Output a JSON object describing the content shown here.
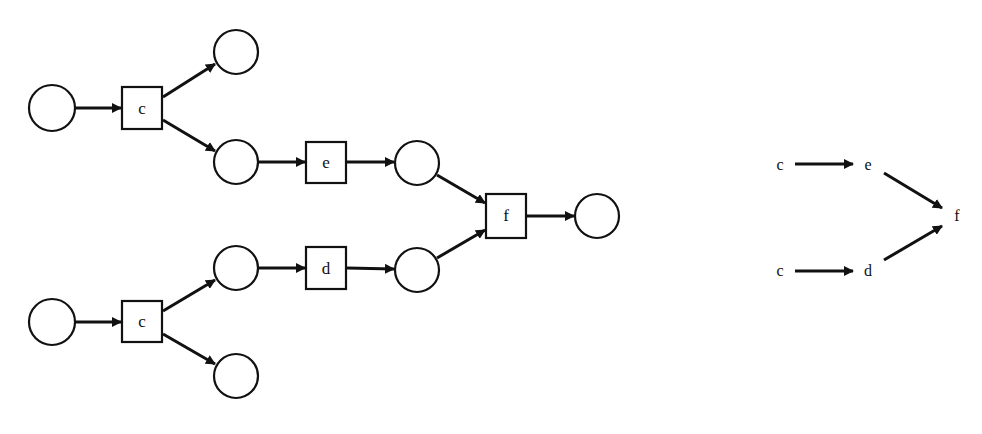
{
  "colors": {
    "stroke": "#111111",
    "background": "#ffffff"
  },
  "petri_net": {
    "places": [
      {
        "id": "p1",
        "cx": 52,
        "cy": 108
      },
      {
        "id": "p2",
        "cx": 236,
        "cy": 52
      },
      {
        "id": "p3",
        "cx": 236,
        "cy": 162
      },
      {
        "id": "p4",
        "cx": 417,
        "cy": 163
      },
      {
        "id": "p5",
        "cx": 597,
        "cy": 216
      },
      {
        "id": "p6",
        "cx": 236,
        "cy": 268
      },
      {
        "id": "p7",
        "cx": 417,
        "cy": 270
      },
      {
        "id": "p8",
        "cx": 52,
        "cy": 322
      },
      {
        "id": "p9",
        "cx": 236,
        "cy": 376
      }
    ],
    "transitions": [
      {
        "id": "t_c1",
        "label": "c"
      },
      {
        "id": "t_e",
        "label": "e"
      },
      {
        "id": "t_f",
        "label": "f"
      },
      {
        "id": "t_d",
        "label": "d"
      },
      {
        "id": "t_c2",
        "label": "c"
      }
    ]
  },
  "dependency_graph": {
    "nodes": [
      {
        "id": "c1",
        "label": "c"
      },
      {
        "id": "e",
        "label": "e"
      },
      {
        "id": "f",
        "label": "f"
      },
      {
        "id": "c2",
        "label": "c"
      },
      {
        "id": "d",
        "label": "d"
      }
    ],
    "edges": [
      {
        "from": "c1",
        "to": "e"
      },
      {
        "from": "e",
        "to": "f"
      },
      {
        "from": "c2",
        "to": "d"
      },
      {
        "from": "d",
        "to": "f"
      }
    ]
  }
}
